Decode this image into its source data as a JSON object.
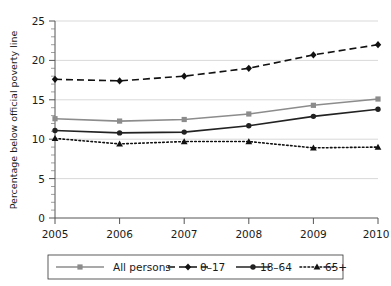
{
  "chart_data": {
    "type": "line",
    "title": "",
    "xlabel": "",
    "ylabel": "Percentage below official poverty line",
    "categories": [
      "2005",
      "2006",
      "2007",
      "2008",
      "2009",
      "2010"
    ],
    "x": [
      2005,
      2006,
      2007,
      2008,
      2009,
      2010
    ],
    "xlim": [
      2005,
      2010
    ],
    "ylim": [
      0,
      25
    ],
    "yticks": [
      "0",
      "5",
      "10",
      "15",
      "20",
      "25"
    ],
    "ytick_values": [
      0,
      5,
      10,
      15,
      20,
      25
    ],
    "grid": "horizontal",
    "legend_position": "bottom",
    "series": [
      {
        "name": "All persons",
        "values": [
          12.6,
          12.3,
          12.5,
          13.2,
          14.3,
          15.1
        ],
        "color": "#8c8c8c",
        "line_style": "solid",
        "marker": "square"
      },
      {
        "name": "0–17",
        "values": [
          17.6,
          17.4,
          18.0,
          19.0,
          20.7,
          22.0
        ],
        "color": "#111111",
        "line_style": "dashed",
        "marker": "diamond"
      },
      {
        "name": "18–64",
        "values": [
          11.1,
          10.8,
          10.9,
          11.7,
          12.9,
          13.8
        ],
        "color": "#222222",
        "line_style": "solid",
        "marker": "circle"
      },
      {
        "name": "65+",
        "values": [
          10.1,
          9.4,
          9.7,
          9.7,
          8.9,
          9.0
        ],
        "color": "#111111",
        "line_style": "dotted",
        "marker": "triangle"
      }
    ]
  },
  "axis": {
    "y_label": "Percentage below official poverty line",
    "y_ticks": [
      "25",
      "20",
      "15",
      "10",
      "5",
      "0"
    ],
    "x_ticks": [
      "2005",
      "2006",
      "2007",
      "2008",
      "2009",
      "2010"
    ]
  },
  "legend": {
    "items": [
      {
        "label": "All persons"
      },
      {
        "label": "0–17"
      },
      {
        "label": "18–64"
      },
      {
        "label": "65+"
      }
    ]
  }
}
